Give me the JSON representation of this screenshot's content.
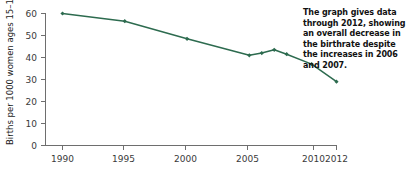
{
  "chart_data": {
    "type": "line",
    "title": "",
    "xlabel": "",
    "ylabel": "Births per 1000 women ages 15–19",
    "x": [
      1990,
      1995,
      2000,
      2005,
      2006,
      2007,
      2008,
      2010,
      2012
    ],
    "values": [
      60.0,
      56.5,
      48.5,
      41.0,
      42.0,
      43.5,
      41.5,
      37.0,
      29.0
    ],
    "series": [
      {
        "name": "Birthrate, women ages 15-19",
        "values": [
          60.0,
          56.5,
          48.5,
          41.0,
          42.0,
          43.5,
          41.5,
          37.0,
          29.0
        ]
      }
    ],
    "xlim": [
      1990,
      2012
    ],
    "ylim": [
      0,
      60
    ],
    "xticks": [
      1990,
      1995,
      2000,
      2005,
      2010,
      2012
    ],
    "xticklabels": [
      "1990",
      "1995",
      "2000",
      "2005",
      "2010",
      "2012"
    ],
    "yticks": [
      0,
      10,
      20,
      30,
      40,
      50,
      60
    ],
    "yticklabels": [
      "0",
      "10",
      "20",
      "30",
      "40",
      "50",
      "60"
    ],
    "grid": false,
    "legend": "none",
    "marker": "diamond",
    "line_color": "#2d6b4f",
    "marker_color": "#2d6b4f",
    "axis_color": "#6e6e6e"
  },
  "annotation": {
    "text": "The graph gives data through 2012, showing an overall decrease in the birthrate despite the increases in 2006 and 2007."
  }
}
